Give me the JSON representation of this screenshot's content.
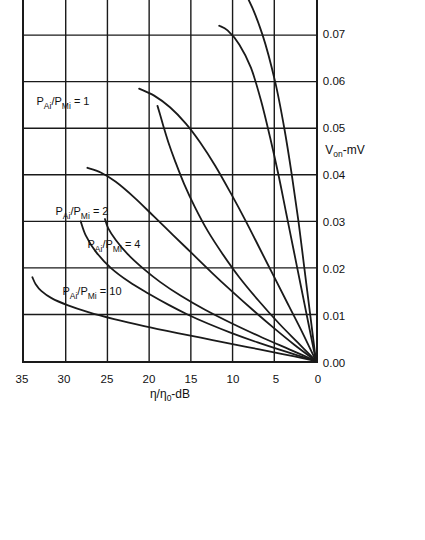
{
  "figure": {
    "background_color": "#ffffff",
    "line_color": "#1a1a1a",
    "frame_color": "#1a1a1a",
    "orientation": "rotated-90-ccw"
  },
  "chart_data": {
    "type": "line",
    "title": "",
    "xlabel": "V_on - mV",
    "xlabel_display": "V",
    "xlabel_sub": "on",
    "xlabel_tail": "-mV",
    "ylabel": "η/η₀ - dB",
    "ylabel_display": "η/η",
    "ylabel_sub": "0",
    "ylabel_tail": "-dB",
    "xlim": [
      0.0,
      0.09
    ],
    "ylim": [
      0,
      35
    ],
    "xticks": [
      0.0,
      0.01,
      0.02,
      0.03,
      0.04,
      0.05,
      0.06,
      0.07,
      0.08,
      0.09
    ],
    "xtick_labels": [
      "0.00",
      "0.01",
      "0.02",
      "0.03",
      "0.04",
      "0.05",
      "0.06",
      "0.07",
      "0.08",
      "0.09"
    ],
    "yticks": [
      0,
      5,
      10,
      15,
      20,
      25,
      30,
      35
    ],
    "ytick_labels": [
      "0",
      "5",
      "10",
      "15",
      "20",
      "25",
      "30",
      "35"
    ],
    "grid": true,
    "grid_x": true,
    "grid_y": true,
    "legend": "inline-annotations",
    "series": [
      {
        "name": "P_Ai/P_Mi = 10",
        "label": "P",
        "label_sub1": "Ai",
        "label_mid": "/P",
        "label_sub2": "Mi",
        "label_value": " = 10",
        "annotation_x": 0.0145,
        "annotation_y": 27.0,
        "branches": [
          {
            "branch": "upper",
            "points": [
              [
                0.0,
                0.0
              ],
              [
                0.0015,
                4.0
              ],
              [
                0.003,
                8.2
              ],
              [
                0.0045,
                12.4
              ],
              [
                0.006,
                16.6
              ],
              [
                0.0075,
                20.6
              ],
              [
                0.009,
                24.2
              ],
              [
                0.0105,
                27.3
              ],
              [
                0.012,
                29.8
              ],
              [
                0.0135,
                31.7
              ],
              [
                0.015,
                32.9
              ],
              [
                0.0165,
                33.6
              ],
              [
                0.018,
                34.0
              ]
            ]
          },
          {
            "branch": "lower",
            "points": [
              [
                0.0,
                0.0
              ],
              [
                0.002,
                3.6
              ],
              [
                0.004,
                7.0
              ],
              [
                0.006,
                10.1
              ],
              [
                0.008,
                12.9
              ],
              [
                0.01,
                15.4
              ],
              [
                0.012,
                17.6
              ],
              [
                0.0145,
                20.1
              ],
              [
                0.017,
                22.4
              ],
              [
                0.02,
                24.6
              ],
              [
                0.0235,
                26.4
              ],
              [
                0.027,
                27.6
              ],
              [
                0.03,
                28.2
              ]
            ]
          }
        ]
      },
      {
        "name": "P_Ai/P_Mi = 4",
        "label": "P",
        "label_sub1": "Ai",
        "label_mid": "/P",
        "label_sub2": "Mi",
        "label_value": " = 4",
        "annotation_x": 0.0245,
        "annotation_y": 24.4,
        "branches": [
          {
            "branch": "upper",
            "points": [
              [
                0.0,
                0.0
              ],
              [
                0.0025,
                3.2
              ],
              [
                0.005,
                6.4
              ],
              [
                0.008,
                10.0
              ],
              [
                0.011,
                13.3
              ],
              [
                0.014,
                16.2
              ],
              [
                0.017,
                18.7
              ],
              [
                0.02,
                20.8
              ],
              [
                0.023,
                22.6
              ],
              [
                0.026,
                24.0
              ],
              [
                0.0285,
                24.9
              ],
              [
                0.0305,
                25.3
              ]
            ]
          },
          {
            "branch": "lower",
            "points": [
              [
                0.0,
                0.0
              ],
              [
                0.0035,
                2.6
              ],
              [
                0.007,
                5.0
              ],
              [
                0.011,
                7.6
              ],
              [
                0.015,
                10.1
              ],
              [
                0.019,
                12.5
              ],
              [
                0.023,
                14.8
              ],
              [
                0.027,
                17.1
              ],
              [
                0.031,
                19.4
              ],
              [
                0.035,
                21.7
              ],
              [
                0.0385,
                24.0
              ],
              [
                0.0405,
                25.8
              ],
              [
                0.0415,
                27.4
              ]
            ]
          }
        ]
      },
      {
        "name": "P_Ai/P_Mi = 2",
        "label": "P",
        "label_sub1": "Ai",
        "label_mid": "/P",
        "label_sub2": "Mi",
        "label_value": " = 2",
        "annotation_x": 0.0315,
        "annotation_y": 28.2,
        "branches": [
          {
            "branch": "upper",
            "points": [
              [
                0.0,
                0.0
              ],
              [
                0.004,
                2.2
              ],
              [
                0.008,
                4.4
              ],
              [
                0.013,
                6.9
              ],
              [
                0.018,
                9.2
              ],
              [
                0.023,
                11.2
              ],
              [
                0.028,
                13.0
              ],
              [
                0.033,
                14.5
              ],
              [
                0.038,
                15.8
              ],
              [
                0.043,
                16.9
              ],
              [
                0.047,
                17.7
              ],
              [
                0.0505,
                18.3
              ],
              [
                0.053,
                18.7
              ],
              [
                0.0548,
                19.0
              ]
            ]
          },
          {
            "branch": "lower",
            "points": [
              [
                0.0,
                0.0
              ],
              [
                0.006,
                1.6
              ],
              [
                0.012,
                3.3
              ],
              [
                0.018,
                5.0
              ],
              [
                0.024,
                6.7
              ],
              [
                0.03,
                8.4
              ],
              [
                0.036,
                10.2
              ],
              [
                0.042,
                12.1
              ],
              [
                0.047,
                13.9
              ],
              [
                0.051,
                15.6
              ],
              [
                0.0545,
                17.5
              ],
              [
                0.057,
                19.4
              ],
              [
                0.0585,
                21.2
              ]
            ]
          }
        ]
      },
      {
        "name": "P_Ai/P_Mi = 1",
        "label": "P",
        "label_sub1": "Ai",
        "label_mid": "/P",
        "label_sub2": "Mi",
        "label_value": " = 1",
        "annotation_x": 0.0548,
        "annotation_y": 30.4,
        "branches": [
          {
            "branch": "upper",
            "points": [
              [
                0.0,
                0.0
              ],
              [
                0.008,
                0.9
              ],
              [
                0.016,
                1.8
              ],
              [
                0.024,
                2.7
              ],
              [
                0.032,
                3.6
              ],
              [
                0.04,
                4.5
              ],
              [
                0.048,
                5.5
              ],
              [
                0.056,
                6.6
              ],
              [
                0.063,
                7.8
              ],
              [
                0.068,
                9.2
              ],
              [
                0.071,
                10.6
              ],
              [
                0.072,
                11.6
              ]
            ]
          },
          {
            "branch": "lower",
            "points": [
              [
                0.0,
                0.0
              ],
              [
                0.01,
                0.7
              ],
              [
                0.02,
                1.4
              ],
              [
                0.03,
                2.1
              ],
              [
                0.04,
                2.9
              ],
              [
                0.05,
                3.8
              ],
              [
                0.06,
                4.9
              ],
              [
                0.07,
                6.4
              ],
              [
                0.078,
                8.2
              ],
              [
                0.084,
                10.6
              ],
              [
                0.0875,
                13.6
              ],
              [
                0.0895,
                17.0
              ],
              [
                0.09,
                19.5
              ]
            ]
          }
        ]
      }
    ]
  }
}
